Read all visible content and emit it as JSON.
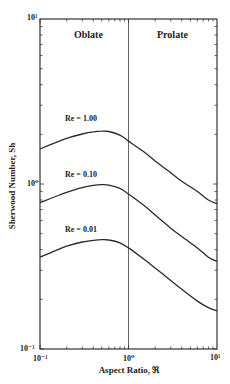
{
  "chart_data": {
    "type": "line",
    "title": "",
    "xlabel": "Aspect Ratio, ℜ",
    "ylabel": "Sherwood Number, Sh",
    "xscale": "log",
    "yscale": "log",
    "xlim": [
      0.1,
      10
    ],
    "ylim": [
      0.1,
      10
    ],
    "x_tick_labels": [
      "10⁻¹",
      "10⁰",
      "10¹"
    ],
    "y_tick_labels": [
      "10¹",
      "10⁰",
      "10⁻¹"
    ],
    "grid": false,
    "divider": {
      "x": 1.0,
      "label_left": "Oblate",
      "label_right": "Prolate"
    },
    "x": [
      0.1,
      0.15,
      0.2,
      0.3,
      0.4,
      0.5,
      0.6,
      0.8,
      1.0,
      1.5,
      2,
      3,
      4,
      6,
      8,
      10
    ],
    "series": [
      {
        "name": "Re = 1.00",
        "values": [
          1.63,
          1.78,
          1.89,
          2.01,
          2.07,
          2.09,
          2.08,
          1.98,
          1.82,
          1.56,
          1.38,
          1.17,
          1.04,
          0.9,
          0.8,
          0.76
        ]
      },
      {
        "name": "Re = 0.10",
        "values": [
          0.77,
          0.84,
          0.89,
          0.95,
          0.98,
          0.99,
          0.985,
          0.94,
          0.87,
          0.74,
          0.65,
          0.54,
          0.48,
          0.41,
          0.36,
          0.34
        ]
      },
      {
        "name": "Re = 0.01",
        "values": [
          0.36,
          0.395,
          0.42,
          0.445,
          0.455,
          0.46,
          0.458,
          0.44,
          0.41,
          0.35,
          0.31,
          0.26,
          0.23,
          0.195,
          0.178,
          0.17
        ]
      }
    ]
  },
  "labels": {
    "oblate": "Oblate",
    "prolate": "Prolate",
    "re_high": "Re  =  1.00",
    "re_mid": "Re  =  0.10",
    "re_low": "Re  =  0.01",
    "xlabel": "Aspect Ratio, ℜ",
    "ylabel": "Sherwood  Number,  Sh",
    "y_top": "10¹",
    "y_mid": "10⁰",
    "y_bot": "10⁻¹",
    "x_left": "10⁻¹",
    "x_mid": "10⁰",
    "x_right": "10¹"
  }
}
